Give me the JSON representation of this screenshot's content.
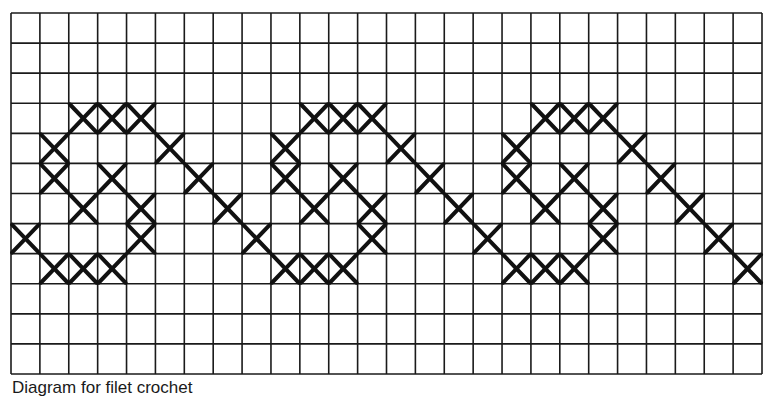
{
  "diagram": {
    "type": "cross-stitch chart",
    "grid": {
      "columns": 26,
      "rows": 12,
      "left": 11,
      "top": 13,
      "right": 762,
      "bottom": 374,
      "line_color": "#1a1a1a",
      "stitch_color": "#111111"
    },
    "stitches": [
      [
        3,
        2
      ],
      [
        3,
        3
      ],
      [
        3,
        4
      ],
      [
        4,
        1
      ],
      [
        4,
        5
      ],
      [
        5,
        1
      ],
      [
        5,
        3
      ],
      [
        5,
        6
      ],
      [
        6,
        2
      ],
      [
        6,
        4
      ],
      [
        6,
        7
      ],
      [
        7,
        0
      ],
      [
        7,
        4
      ],
      [
        7,
        8
      ],
      [
        8,
        1
      ],
      [
        8,
        2
      ],
      [
        8,
        3
      ],
      [
        3,
        10
      ],
      [
        3,
        11
      ],
      [
        3,
        12
      ],
      [
        4,
        9
      ],
      [
        4,
        13
      ],
      [
        5,
        9
      ],
      [
        5,
        11
      ],
      [
        5,
        14
      ],
      [
        6,
        10
      ],
      [
        6,
        12
      ],
      [
        6,
        15
      ],
      [
        7,
        12
      ],
      [
        7,
        16
      ],
      [
        8,
        9
      ],
      [
        8,
        10
      ],
      [
        8,
        11
      ],
      [
        3,
        18
      ],
      [
        3,
        19
      ],
      [
        3,
        20
      ],
      [
        4,
        17
      ],
      [
        4,
        21
      ],
      [
        5,
        17
      ],
      [
        5,
        19
      ],
      [
        5,
        22
      ],
      [
        6,
        18
      ],
      [
        6,
        20
      ],
      [
        6,
        23
      ],
      [
        7,
        20
      ],
      [
        7,
        24
      ],
      [
        8,
        17
      ],
      [
        8,
        18
      ],
      [
        8,
        19
      ],
      [
        8,
        25
      ]
    ]
  },
  "caption": "Diagram for filet crochet"
}
